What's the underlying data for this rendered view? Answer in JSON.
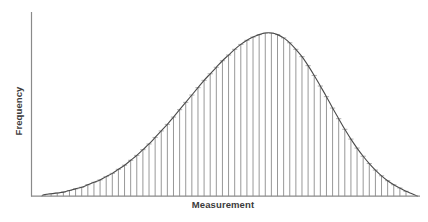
{
  "chart_data": {
    "type": "bar",
    "title": "",
    "subtitle": "",
    "xlabel": "Measurement",
    "ylabel": "Frequency",
    "grid": false,
    "legend": false,
    "legend_position": "none",
    "xlim": [
      0,
      60
    ],
    "ylim": [
      0,
      100
    ],
    "x_tick_labels": [],
    "y_tick_labels": [],
    "axis_color": "#8a8a8a",
    "bar_color": "#8c8c8c",
    "curve_color": "#4a4a4a",
    "background_color": "#ffffff",
    "text_color": "#3b3b3b",
    "categories": [
      "1",
      "2",
      "3",
      "4",
      "5",
      "6",
      "7",
      "8",
      "9",
      "10",
      "11",
      "12",
      "13",
      "14",
      "15",
      "16",
      "17",
      "18",
      "19",
      "20",
      "21",
      "22",
      "23",
      "24",
      "25",
      "26",
      "27",
      "28",
      "29",
      "30",
      "31",
      "32",
      "33",
      "34",
      "35",
      "36",
      "37",
      "38",
      "39",
      "40",
      "41",
      "42",
      "43",
      "44",
      "45",
      "46",
      "47",
      "48",
      "49",
      "50",
      "51",
      "52",
      "53",
      "54",
      "55",
      "56",
      "57",
      "58",
      "59",
      "60"
    ],
    "values": [
      1,
      1.5,
      2,
      2.5,
      3.5,
      4.5,
      5.5,
      7,
      8.5,
      10,
      12,
      14,
      16.5,
      19,
      22,
      25,
      28.5,
      32,
      36,
      40,
      44,
      48.5,
      53,
      57.5,
      62,
      66.5,
      71,
      75,
      79,
      83,
      86.5,
      90,
      93,
      95.5,
      97.5,
      99,
      100,
      100,
      99,
      97,
      94,
      90,
      85.5,
      80,
      74,
      67.5,
      61,
      54,
      47.5,
      41,
      35,
      29.5,
      24.5,
      20,
      16,
      12.5,
      9.5,
      7,
      5,
      3
    ],
    "series": [
      {
        "name": "Frequency",
        "values": [
          1,
          1.5,
          2,
          2.5,
          3.5,
          4.5,
          5.5,
          7,
          8.5,
          10,
          12,
          14,
          16.5,
          19,
          22,
          25,
          28.5,
          32,
          36,
          40,
          44,
          48.5,
          53,
          57.5,
          62,
          66.5,
          71,
          75,
          79,
          83,
          86.5,
          90,
          93,
          95.5,
          97.5,
          99,
          100,
          100,
          99,
          97,
          94,
          90,
          85.5,
          80,
          74,
          67.5,
          61,
          54,
          47.5,
          41,
          35,
          29.5,
          24.5,
          20,
          16,
          12.5,
          9.5,
          7,
          5,
          3
        ]
      }
    ],
    "overlay_curve": {
      "name": "normal-distribution-curve",
      "type": "line",
      "peak_category": "37",
      "peak_value": 100
    }
  },
  "axes": {
    "x_label": "Measurement",
    "y_label": "Frequency"
  }
}
